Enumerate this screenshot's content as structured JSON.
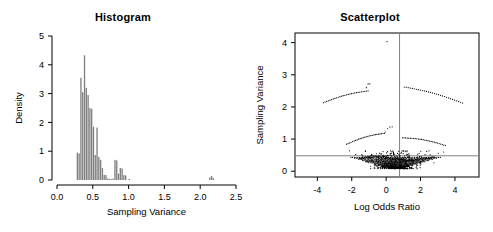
{
  "figure": {
    "panels": [
      "Histogram",
      "Scatterplot"
    ],
    "background": "#ffffff",
    "foreground": "#000000"
  },
  "histogram": {
    "title": "Histogram",
    "bar_color": "#808080",
    "border_color": "#000000"
  },
  "scatterplot": {
    "title": "Scatterplot",
    "point_color": "#000000",
    "reference_line_color": "#808080"
  },
  "chart_data": [
    {
      "type": "bar",
      "title": "Histogram",
      "xlabel": "Sampling Variance",
      "ylabel": "Density",
      "xlim": [
        0.0,
        2.5
      ],
      "ylim": [
        0,
        5
      ],
      "xticks": [
        "0.0",
        "0.5",
        "1.0",
        "1.5",
        "2.0",
        "2.5"
      ],
      "xtick_values": [
        0.0,
        0.5,
        1.0,
        1.5,
        2.0,
        2.5
      ],
      "yticks": [
        "0",
        "1",
        "2",
        "3",
        "4",
        "5"
      ],
      "ytick_values": [
        0,
        1,
        2,
        3,
        4,
        5
      ],
      "grid": false,
      "legend": "none",
      "bin_width": 0.025,
      "bin_starts": [
        0.275,
        0.3,
        0.325,
        0.35,
        0.375,
        0.4,
        0.425,
        0.45,
        0.475,
        0.5,
        0.525,
        0.55,
        0.575,
        0.6,
        0.625,
        0.65,
        0.675,
        0.7,
        0.725,
        0.75,
        0.775,
        0.8,
        0.825,
        0.85,
        0.875,
        0.9,
        0.925,
        0.95,
        1.0,
        2.125,
        2.15,
        2.175
      ],
      "values": [
        0.95,
        0.92,
        3.55,
        3.05,
        4.33,
        3.2,
        2.95,
        2.5,
        2.47,
        1.85,
        0.87,
        1.82,
        0.8,
        0.7,
        0.42,
        0.18,
        0.17,
        0.05,
        0.04,
        0.03,
        0.05,
        0.7,
        0.68,
        0.22,
        0.42,
        0.4,
        0.17,
        0.16,
        0.04,
        0.09,
        0.14,
        0.07
      ],
      "categories": [
        "0.275",
        "0.300",
        "0.325",
        "0.350",
        "0.375",
        "0.400",
        "0.425",
        "0.450",
        "0.475",
        "0.500",
        "0.525",
        "0.550",
        "0.575",
        "0.600",
        "0.625",
        "0.650",
        "0.675",
        "0.700",
        "0.725",
        "0.750",
        "0.775",
        "0.800",
        "0.825",
        "0.850",
        "0.875",
        "0.900",
        "0.925",
        "0.950",
        "1.000",
        "2.125",
        "2.150",
        "2.175"
      ]
    },
    {
      "type": "scatter",
      "title": "Scatterplot",
      "xlabel": "Log Odds Ratio",
      "ylabel": "Sampling Variance",
      "xlim": [
        -5.3,
        5.4
      ],
      "ylim": [
        -0.18,
        4.3
      ],
      "xticks": [
        "-4",
        "-2",
        "0",
        "2",
        "4"
      ],
      "xtick_values": [
        -4,
        -2,
        0,
        2,
        4
      ],
      "yticks": [
        "0",
        "1",
        "2",
        "3",
        "4"
      ],
      "ytick_values": [
        0,
        1,
        2,
        3,
        4
      ],
      "grid": false,
      "legend": "none",
      "box_frame": true,
      "annotations": [
        {
          "kind": "vline",
          "x": 0.78,
          "color": "#808080"
        },
        {
          "kind": "hline",
          "y": 0.48,
          "color": "#808080"
        }
      ],
      "arcs": [
        {
          "name": "upper-left-band",
          "n": 28,
          "x_from": -3.65,
          "x_to": -1.05,
          "y_from": 2.13,
          "y_to": 2.5
        },
        {
          "name": "upper-right-band",
          "n": 30,
          "x_from": 1.05,
          "x_to": 4.45,
          "y_from": 2.62,
          "y_to": 2.12
        },
        {
          "name": "peak-left",
          "n": 3,
          "x_from": -1.15,
          "x_to": -0.95,
          "y_from": 2.6,
          "y_to": 2.72
        },
        {
          "name": "top-outlier",
          "n": 1,
          "x_from": 0.05,
          "x_to": 0.05,
          "y_from": 4.03,
          "y_to": 4.03
        },
        {
          "name": "mid-left-band",
          "n": 26,
          "x_from": -2.3,
          "x_to": -0.1,
          "y_from": 0.84,
          "y_to": 1.18
        },
        {
          "name": "mid-right-band",
          "n": 28,
          "x_from": 0.95,
          "x_to": 3.45,
          "y_from": 1.04,
          "y_to": 0.8
        },
        {
          "name": "mid-peak",
          "n": 4,
          "x_from": -0.05,
          "x_to": 0.35,
          "y_from": 1.22,
          "y_to": 1.38
        },
        {
          "name": "core-fan",
          "n": 420,
          "x_from": -2.1,
          "x_to": 3.0,
          "y_from": 0.1,
          "y_to": 0.6
        }
      ]
    }
  ]
}
